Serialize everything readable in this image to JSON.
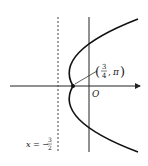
{
  "diagram": {
    "type": "polar-parabola",
    "origin_label": "O",
    "point": {
      "r_num": "3",
      "r_den": "4",
      "theta": "π",
      "label": "(3/4, π)"
    },
    "directrix": {
      "lhs": "x = −",
      "num": "3",
      "den": "2",
      "label": "x = −3/2"
    },
    "colors": {
      "curve": "#111111",
      "axis": "#222222",
      "directrix": "#444444"
    }
  }
}
